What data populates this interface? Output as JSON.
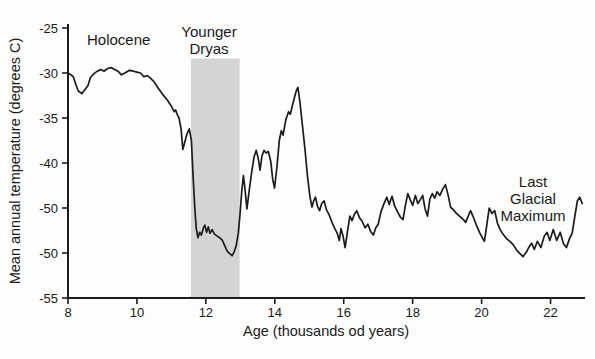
{
  "figure": {
    "background": "#fdfdfd",
    "axis_color": "#1c1c1c",
    "line_color": "#1c1c1c",
    "band_color": "#d4d4d4",
    "text_color": "#1a1a1a"
  },
  "chart_data": {
    "type": "line",
    "title": "",
    "xlabel": "Age (thousands od years)",
    "ylabel": "Mean annual temperature (degrees C)",
    "xlim": [
      8,
      23
    ],
    "ylim": [
      -55,
      -25
    ],
    "grid": false,
    "legend_position": "none",
    "x_ticks": [
      {
        "v": 8,
        "label": "8"
      },
      {
        "v": 10,
        "label": "10"
      },
      {
        "v": 12,
        "label": "12"
      },
      {
        "v": 14,
        "label": "14"
      },
      {
        "v": 16,
        "label": "16"
      },
      {
        "v": 18,
        "label": "18"
      },
      {
        "v": 20,
        "label": "20"
      },
      {
        "v": 22,
        "label": "22"
      }
    ],
    "y_ticks": [
      {
        "v": -25,
        "label": "-25"
      },
      {
        "v": -30,
        "label": "-30"
      },
      {
        "v": -35,
        "label": "-35"
      },
      {
        "v": -40,
        "label": "-40"
      },
      {
        "v": -45,
        "label": "-50"
      },
      {
        "v": -50,
        "label": "-50"
      },
      {
        "v": -55,
        "label": "-55"
      }
    ],
    "shaded_band": {
      "label": "Younger Dryas",
      "x_start": 11.57,
      "x_end": 12.98,
      "top_value": -28.4,
      "color": "#d4d4d4"
    },
    "annotations": [
      {
        "id": "holocene",
        "text": "Holocene",
        "x": 8.55,
        "y": -25.3,
        "anchor": "left"
      },
      {
        "id": "younger-dryas",
        "text": "Younger\nDryas",
        "x": 12.1,
        "y": -24.45,
        "anchor": "center"
      },
      {
        "id": "last-glacial-maximum",
        "text": "Last Glacial\nMaximum",
        "x": 21.5,
        "y": -41.1,
        "anchor": "center"
      }
    ],
    "series": [
      {
        "name": "Mean annual temperature",
        "points": [
          [
            8.0,
            -30.0
          ],
          [
            8.08,
            -30.2
          ],
          [
            8.15,
            -30.4
          ],
          [
            8.22,
            -31.2
          ],
          [
            8.3,
            -32.0
          ],
          [
            8.4,
            -32.3
          ],
          [
            8.5,
            -31.8
          ],
          [
            8.58,
            -31.4
          ],
          [
            8.65,
            -30.5
          ],
          [
            8.75,
            -30.1
          ],
          [
            8.85,
            -29.8
          ],
          [
            8.95,
            -29.6
          ],
          [
            9.05,
            -29.8
          ],
          [
            9.15,
            -29.5
          ],
          [
            9.25,
            -29.4
          ],
          [
            9.35,
            -29.6
          ],
          [
            9.45,
            -29.8
          ],
          [
            9.55,
            -30.2
          ],
          [
            9.65,
            -30.0
          ],
          [
            9.78,
            -29.7
          ],
          [
            9.9,
            -29.8
          ],
          [
            10.0,
            -29.9
          ],
          [
            10.1,
            -30.0
          ],
          [
            10.2,
            -30.4
          ],
          [
            10.3,
            -30.3
          ],
          [
            10.4,
            -30.6
          ],
          [
            10.5,
            -31.0
          ],
          [
            10.62,
            -31.7
          ],
          [
            10.75,
            -32.4
          ],
          [
            10.88,
            -33.0
          ],
          [
            11.0,
            -33.7
          ],
          [
            11.08,
            -34.3
          ],
          [
            11.12,
            -34.1
          ],
          [
            11.18,
            -34.7
          ],
          [
            11.22,
            -35.0
          ],
          [
            11.28,
            -36.2
          ],
          [
            11.33,
            -38.5
          ],
          [
            11.38,
            -37.8
          ],
          [
            11.45,
            -36.8
          ],
          [
            11.52,
            -36.2
          ],
          [
            11.58,
            -37.5
          ],
          [
            11.63,
            -41.5
          ],
          [
            11.68,
            -45.0
          ],
          [
            11.72,
            -47.2
          ],
          [
            11.77,
            -48.3
          ],
          [
            11.82,
            -47.7
          ],
          [
            11.87,
            -48.0
          ],
          [
            11.92,
            -47.3
          ],
          [
            11.97,
            -46.9
          ],
          [
            12.02,
            -47.7
          ],
          [
            12.07,
            -47.1
          ],
          [
            12.12,
            -47.8
          ],
          [
            12.18,
            -47.4
          ],
          [
            12.25,
            -47.9
          ],
          [
            12.32,
            -48.1
          ],
          [
            12.4,
            -48.3
          ],
          [
            12.48,
            -48.6
          ],
          [
            12.55,
            -49.2
          ],
          [
            12.62,
            -49.8
          ],
          [
            12.7,
            -50.1
          ],
          [
            12.76,
            -50.3
          ],
          [
            12.82,
            -49.9
          ],
          [
            12.88,
            -49.2
          ],
          [
            12.94,
            -47.8
          ],
          [
            12.99,
            -45.7
          ],
          [
            13.04,
            -43.2
          ],
          [
            13.09,
            -41.4
          ],
          [
            13.14,
            -43.1
          ],
          [
            13.19,
            -45.1
          ],
          [
            13.26,
            -43.0
          ],
          [
            13.33,
            -41.0
          ],
          [
            13.4,
            -39.3
          ],
          [
            13.46,
            -38.6
          ],
          [
            13.52,
            -39.5
          ],
          [
            13.57,
            -40.8
          ],
          [
            13.63,
            -39.2
          ],
          [
            13.69,
            -38.6
          ],
          [
            13.75,
            -38.9
          ],
          [
            13.81,
            -38.7
          ],
          [
            13.88,
            -39.8
          ],
          [
            13.94,
            -41.8
          ],
          [
            13.99,
            -42.8
          ],
          [
            14.06,
            -40.5
          ],
          [
            14.13,
            -37.5
          ],
          [
            14.19,
            -36.4
          ],
          [
            14.24,
            -36.9
          ],
          [
            14.32,
            -35.2
          ],
          [
            14.4,
            -34.3
          ],
          [
            14.45,
            -34.6
          ],
          [
            14.53,
            -33.3
          ],
          [
            14.62,
            -32.0
          ],
          [
            14.67,
            -31.6
          ],
          [
            14.73,
            -33.3
          ],
          [
            14.8,
            -35.8
          ],
          [
            14.88,
            -38.6
          ],
          [
            14.95,
            -41.5
          ],
          [
            15.02,
            -43.8
          ],
          [
            15.08,
            -44.9
          ],
          [
            15.13,
            -44.2
          ],
          [
            15.18,
            -43.8
          ],
          [
            15.24,
            -44.8
          ],
          [
            15.3,
            -45.3
          ],
          [
            15.36,
            -44.5
          ],
          [
            15.43,
            -44.2
          ],
          [
            15.5,
            -45.2
          ],
          [
            15.58,
            -45.8
          ],
          [
            15.66,
            -46.6
          ],
          [
            15.74,
            -47.3
          ],
          [
            15.81,
            -47.8
          ],
          [
            15.87,
            -48.6
          ],
          [
            15.92,
            -47.3
          ],
          [
            15.98,
            -48.1
          ],
          [
            16.04,
            -49.4
          ],
          [
            16.11,
            -47.6
          ],
          [
            16.18,
            -45.9
          ],
          [
            16.24,
            -46.4
          ],
          [
            16.31,
            -45.7
          ],
          [
            16.38,
            -45.3
          ],
          [
            16.46,
            -46.1
          ],
          [
            16.54,
            -46.5
          ],
          [
            16.62,
            -47.2
          ],
          [
            16.7,
            -46.8
          ],
          [
            16.78,
            -47.6
          ],
          [
            16.86,
            -48.0
          ],
          [
            16.93,
            -47.2
          ],
          [
            17.0,
            -46.8
          ],
          [
            17.08,
            -45.4
          ],
          [
            17.16,
            -44.6
          ],
          [
            17.25,
            -43.8
          ],
          [
            17.32,
            -44.6
          ],
          [
            17.4,
            -43.7
          ],
          [
            17.48,
            -44.8
          ],
          [
            17.56,
            -45.4
          ],
          [
            17.64,
            -46.0
          ],
          [
            17.72,
            -46.3
          ],
          [
            17.79,
            -44.7
          ],
          [
            17.86,
            -43.4
          ],
          [
            17.93,
            -44.1
          ],
          [
            18.0,
            -44.7
          ],
          [
            18.08,
            -43.6
          ],
          [
            18.15,
            -44.5
          ],
          [
            18.22,
            -44.1
          ],
          [
            18.29,
            -43.6
          ],
          [
            18.36,
            -45.1
          ],
          [
            18.43,
            -45.9
          ],
          [
            18.5,
            -44.0
          ],
          [
            18.57,
            -43.4
          ],
          [
            18.64,
            -43.9
          ],
          [
            18.71,
            -43.2
          ],
          [
            18.79,
            -43.6
          ],
          [
            18.87,
            -42.9
          ],
          [
            18.95,
            -42.4
          ],
          [
            19.03,
            -43.6
          ],
          [
            19.1,
            -44.9
          ],
          [
            19.18,
            -45.2
          ],
          [
            19.27,
            -45.6
          ],
          [
            19.36,
            -45.9
          ],
          [
            19.45,
            -46.2
          ],
          [
            19.54,
            -46.6
          ],
          [
            19.61,
            -45.9
          ],
          [
            19.68,
            -45.3
          ],
          [
            19.76,
            -46.0
          ],
          [
            19.85,
            -46.9
          ],
          [
            19.94,
            -47.7
          ],
          [
            20.02,
            -48.3
          ],
          [
            20.08,
            -48.7
          ],
          [
            20.15,
            -46.9
          ],
          [
            20.22,
            -45.0
          ],
          [
            20.3,
            -45.6
          ],
          [
            20.38,
            -45.3
          ],
          [
            20.46,
            -46.7
          ],
          [
            20.54,
            -47.4
          ],
          [
            20.62,
            -47.9
          ],
          [
            20.72,
            -48.4
          ],
          [
            20.82,
            -48.7
          ],
          [
            20.92,
            -49.1
          ],
          [
            21.02,
            -49.7
          ],
          [
            21.12,
            -50.1
          ],
          [
            21.2,
            -50.4
          ],
          [
            21.3,
            -49.9
          ],
          [
            21.38,
            -49.3
          ],
          [
            21.45,
            -48.9
          ],
          [
            21.53,
            -49.6
          ],
          [
            21.62,
            -48.7
          ],
          [
            21.72,
            -49.4
          ],
          [
            21.82,
            -48.1
          ],
          [
            21.9,
            -47.7
          ],
          [
            21.98,
            -48.6
          ],
          [
            22.08,
            -47.4
          ],
          [
            22.18,
            -48.6
          ],
          [
            22.28,
            -47.7
          ],
          [
            22.38,
            -49.0
          ],
          [
            22.46,
            -49.4
          ],
          [
            22.55,
            -48.4
          ],
          [
            22.63,
            -47.8
          ],
          [
            22.7,
            -46.0
          ],
          [
            22.78,
            -44.2
          ],
          [
            22.85,
            -43.8
          ],
          [
            22.92,
            -44.5
          ]
        ]
      }
    ]
  }
}
